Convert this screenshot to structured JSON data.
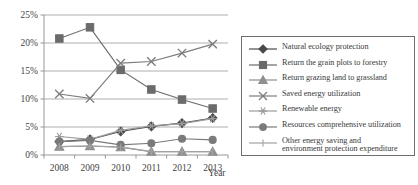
{
  "chart_data": {
    "type": "line",
    "title": "",
    "xlabel": "Year",
    "ylabel": "",
    "categories": [
      "2008",
      "2009",
      "2010",
      "2011",
      "2012",
      "2013"
    ],
    "x_tick_labels": [
      "2008",
      "2009",
      "2010",
      "2011",
      "2012",
      "2013"
    ],
    "y_tick_labels": [
      "0%",
      "5%",
      "10%",
      "15%",
      "20%",
      "25%"
    ],
    "y_tick_values": [
      0,
      5,
      10,
      15,
      20,
      25
    ],
    "ylim": [
      0,
      25
    ],
    "grid": true,
    "legend_position": "right",
    "units": "percent",
    "series": [
      {
        "name": "Natural ecology protection",
        "marker": "diamond",
        "color": "#4a4a4a",
        "values": [
          2.4,
          2.8,
          4.2,
          5.1,
          5.7,
          6.6
        ]
      },
      {
        "name": "Return the grain plots to forestry",
        "marker": "square",
        "color": "#6b6b6b",
        "values": [
          20.8,
          22.8,
          15.2,
          11.7,
          9.9,
          8.3
        ]
      },
      {
        "name": "Return grazing land to grassland",
        "marker": "triangle",
        "color": "#8f8f8f",
        "values": [
          1.5,
          1.6,
          1.4,
          0.6,
          0.6,
          0.6
        ]
      },
      {
        "name": "Saved energy utilization",
        "marker": "x",
        "color": "#7d7d7d",
        "values": [
          10.9,
          10.1,
          16.4,
          16.7,
          18.2,
          19.8
        ]
      },
      {
        "name": "Renewable energy",
        "marker": "asterisk",
        "color": "#9b9b9b",
        "values": [
          3.3,
          2.8,
          4.4,
          5.2,
          5.6,
          6.5
        ]
      },
      {
        "name": "Resources comprehensive utilization",
        "marker": "circle",
        "color": "#7a7a7a",
        "values": [
          2.4,
          2.6,
          1.8,
          2.1,
          2.9,
          2.7
        ]
      },
      {
        "name": "Other energy saving and\nenvironment protection expenditure",
        "marker": "plus",
        "color": "#a2a2a2",
        "values": [
          1.5,
          1.6,
          1.4,
          0.6,
          0.6,
          0.6
        ]
      }
    ]
  },
  "legend": {
    "items": [
      {
        "label": "Natural ecology protection",
        "marker": "diamond",
        "color": "#4a4a4a"
      },
      {
        "label": "Return the grain plots to forestry",
        "marker": "square",
        "color": "#6b6b6b"
      },
      {
        "label": "Return grazing land to grassland",
        "marker": "triangle",
        "color": "#8f8f8f"
      },
      {
        "label": "Saved energy utilization",
        "marker": "x",
        "color": "#7d7d7d"
      },
      {
        "label": "Renewable energy",
        "marker": "asterisk",
        "color": "#9b9b9b"
      },
      {
        "label": "Resources comprehensive utilization",
        "marker": "circle",
        "color": "#7a7a7a"
      },
      {
        "label": "Other energy saving and\nenvironment protection expenditure",
        "marker": "plus",
        "color": "#a2a2a2"
      }
    ]
  },
  "axes": {
    "x_axis_title": "Year"
  }
}
